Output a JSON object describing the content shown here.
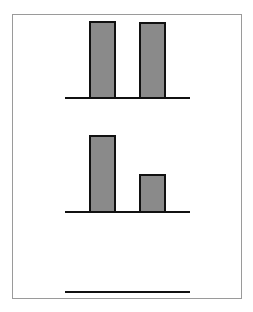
{
  "chart_data": [
    {
      "type": "bar",
      "title": "",
      "xlabel": "",
      "ylabel": "",
      "categories": [
        "A",
        "B"
      ],
      "values": [
        76,
        75
      ],
      "colors": {
        "bar_fill": "#8a8a8a",
        "bar_stroke": "#111111"
      },
      "grid": false,
      "legend": "none"
    },
    {
      "type": "bar",
      "title": "",
      "xlabel": "",
      "ylabel": "",
      "categories": [
        "A",
        "B"
      ],
      "values": [
        76,
        37
      ],
      "colors": {
        "bar_fill": "#8a8a8a",
        "bar_stroke": "#111111"
      },
      "grid": false,
      "legend": "none"
    },
    {
      "type": "bar",
      "title": "",
      "xlabel": "",
      "ylabel": "",
      "categories": [],
      "values": [],
      "grid": false,
      "legend": "none"
    }
  ],
  "layout": {
    "panels": [
      {
        "baseline_y": 97,
        "bars": [
          {
            "x": 89,
            "height": 76
          },
          {
            "x": 139,
            "height": 75
          }
        ]
      },
      {
        "baseline_y": 211,
        "bars": [
          {
            "x": 89,
            "height": 76
          },
          {
            "x": 139,
            "height": 37
          }
        ]
      },
      {
        "baseline_y": 291,
        "bars": []
      }
    ]
  }
}
